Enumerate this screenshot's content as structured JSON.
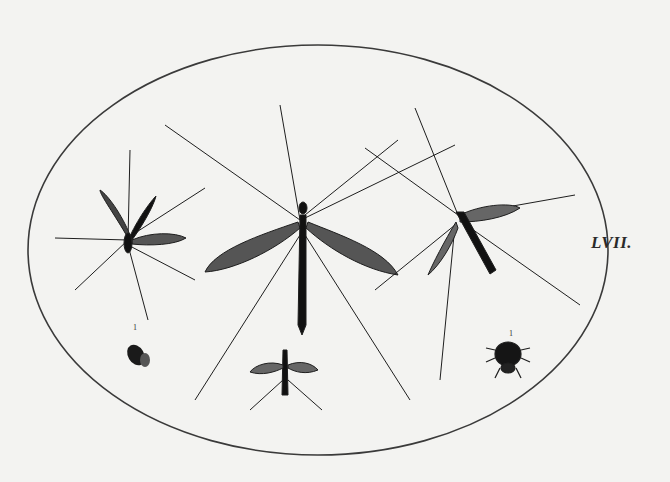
{
  "plate": {
    "label": "LVII.",
    "background_color": "#f3f3f1",
    "ink_color": "#1e1e1e"
  },
  "figures": [
    {
      "name": "crane-fly-left",
      "numeral": ""
    },
    {
      "name": "crane-fly-center",
      "numeral": ""
    },
    {
      "name": "crane-fly-right",
      "numeral": ""
    },
    {
      "name": "small-fly",
      "numeral": "1"
    },
    {
      "name": "gnat-bottom",
      "numeral": ""
    },
    {
      "name": "spider-mite",
      "numeral": "1"
    }
  ]
}
